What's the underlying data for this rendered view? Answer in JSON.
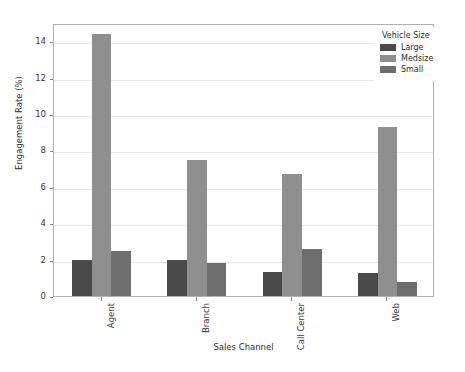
{
  "chart_data": {
    "type": "bar",
    "title": "",
    "xlabel": "Sales Channel",
    "ylabel": "Engagement Rate (%)",
    "categories": [
      "Agent",
      "Branch",
      "Call Center",
      "Web"
    ],
    "series": [
      {
        "name": "Large",
        "color": "#4a4a4a",
        "values": [
          2.0,
          2.0,
          1.3,
          1.25
        ]
      },
      {
        "name": "Medsize",
        "color": "#8f8f8f",
        "values": [
          14.4,
          7.45,
          6.7,
          9.3
        ]
      },
      {
        "name": "Small",
        "color": "#6e6e6e",
        "values": [
          2.5,
          1.8,
          2.6,
          0.75
        ]
      }
    ],
    "ylim": [
      0,
      15
    ],
    "yticks": [
      0,
      2,
      4,
      6,
      8,
      10,
      12,
      14
    ],
    "ytick_labels": [
      "0",
      "2",
      "4",
      "6",
      "8",
      "10",
      "12",
      "14"
    ],
    "xtick_rotation": 90,
    "grid": true,
    "grid_axis": "y",
    "legend": {
      "title": "Vehicle Size",
      "position": "upper right",
      "entries": [
        "Large",
        "Medsize",
        "Small"
      ]
    }
  }
}
